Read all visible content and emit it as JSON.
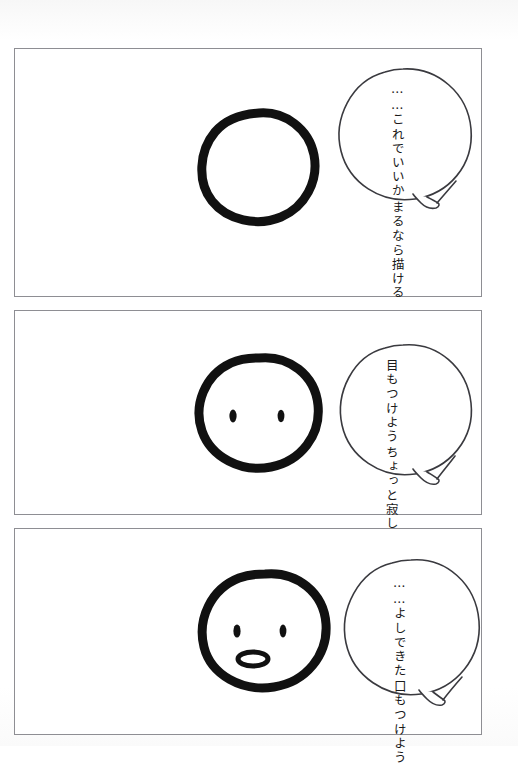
{
  "page": {
    "type": "4-koma-style manga strip",
    "background_color": "#fdfdfd",
    "panel_border_color": "#8e8e93",
    "ink_color": "#111111",
    "bubble_outline_color": "#3a3a3f",
    "width": 518,
    "height": 746
  },
  "panels": [
    {
      "index": 1,
      "name": "panel-one",
      "drawing": {
        "name": "blank-circle-face",
        "description": "hand-drawn thick black circle, no features"
      },
      "bubble": {
        "tail": "bottom-right",
        "lines": [
          "まるなら描ける",
          "……これでいいか"
        ]
      }
    },
    {
      "index": 2,
      "name": "panel-two",
      "drawing": {
        "name": "face-with-eyes",
        "description": "hand-drawn circle face with two small oval eyes"
      },
      "bubble": {
        "tail": "bottom-right",
        "lines": [
          "ちょっと寂しいな",
          "目もつけよう"
        ]
      }
    },
    {
      "index": 3,
      "name": "panel-three",
      "drawing": {
        "name": "face-with-eyes-and-mouth",
        "description": "hand-drawn circle face with two eyes and an open oval mouth"
      },
      "bubble": {
        "tail": "bottom-right",
        "lines": [
          "口もつけよう",
          "……よしできた"
        ]
      }
    }
  ]
}
